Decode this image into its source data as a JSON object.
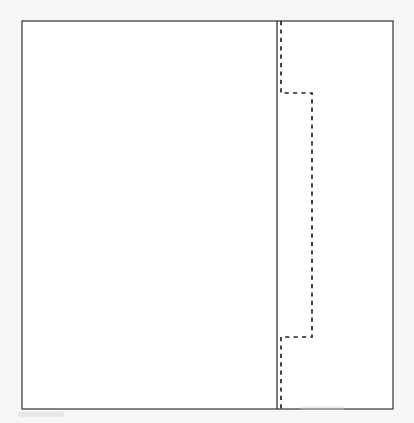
{
  "figure": {
    "title": "Stepped dashed profile within rectangular boundary",
    "caption": "",
    "background_color": "#fdfdfc",
    "page_color": "#ffffff"
  },
  "canvas": {
    "width": 414,
    "height": 423
  },
  "frame": {
    "label": "boundary-rectangle",
    "x": 22,
    "y": 21,
    "width": 371,
    "height": 388,
    "stroke_color": "#2a2a2a",
    "stroke_width": 1.15,
    "fill_color": "#ffffff"
  },
  "solid_divider": {
    "label": "vertical-reference-line",
    "x": 277,
    "y_top": 21,
    "y_bottom": 409,
    "stroke_color": "#2b2b2b",
    "stroke_width": 1.25,
    "style": "solid"
  },
  "dashed_profile": {
    "label": "stepped-profile-curve",
    "style": "dashed",
    "stroke_color": "#232323",
    "stroke_width": 1.7,
    "dash_on": 4.2,
    "dash_off": 4.2,
    "points": [
      {
        "x": 281,
        "y": 21
      },
      {
        "x": 281,
        "y": 93
      },
      {
        "x": 312,
        "y": 93
      },
      {
        "x": 312,
        "y": 337
      },
      {
        "x": 281,
        "y": 337
      },
      {
        "x": 281,
        "y": 409
      }
    ],
    "segments": [
      {
        "name": "upper-vertical",
        "orientation": "vertical",
        "x": 281,
        "from": 21,
        "to": 93
      },
      {
        "name": "upper-step",
        "orientation": "horizontal",
        "y": 93,
        "from": 281,
        "to": 312
      },
      {
        "name": "middle-vertical",
        "orientation": "vertical",
        "x": 312,
        "from": 93,
        "to": 337
      },
      {
        "name": "lower-step",
        "orientation": "horizontal",
        "y": 337,
        "from": 281,
        "to": 312
      },
      {
        "name": "lower-vertical",
        "orientation": "vertical",
        "x": 281,
        "from": 337,
        "to": 409
      }
    ]
  },
  "artifacts": [
    {
      "label": "bottom-left-smudge",
      "x": 18,
      "y": 412,
      "width": 46,
      "height": 5
    },
    {
      "label": "bottom-center-smudge",
      "x": 300,
      "y": 406,
      "width": 44,
      "height": 4
    }
  ],
  "chart_data": {
    "type": "line",
    "title": "Stepped dashed profile within rectangular boundary",
    "subtitle": "",
    "xlabel": "",
    "ylabel": "",
    "grid": false,
    "legend": "none",
    "xlim": [
      22,
      393
    ],
    "ylim": [
      21,
      409
    ],
    "annotations": [],
    "series": [
      {
        "name": "vertical reference line",
        "style": "solid",
        "color": "#2b2b2b",
        "x": [
          277,
          277
        ],
        "y": [
          21,
          409
        ]
      },
      {
        "name": "stepped profile",
        "style": "dashed",
        "color": "#232323",
        "x": [
          281,
          281,
          312,
          312,
          281,
          281
        ],
        "y": [
          21,
          93,
          93,
          337,
          337,
          409
        ]
      }
    ]
  }
}
